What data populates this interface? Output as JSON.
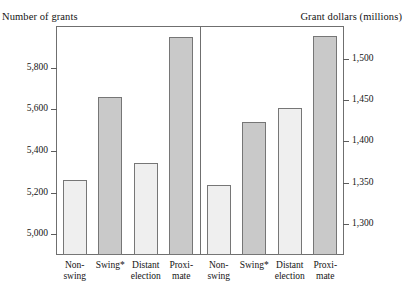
{
  "header": {
    "left_caption": "Number of grants",
    "right_caption": "Grant dollars (millions)"
  },
  "chart_data": {
    "type": "bar",
    "title": "",
    "subtitle": "",
    "grid": false,
    "legend": "none",
    "panels": [
      {
        "name": "number-of-grants",
        "ylabel": "Number of grants",
        "xlabel": "",
        "ylim": [
          4900,
          6000
        ],
        "yticks": [
          5000,
          5200,
          5400,
          5600,
          5800
        ],
        "ytick_labels": [
          "5,000",
          "5,200",
          "5,400",
          "5,600",
          "5,800"
        ],
        "categories": [
          "Non-swing",
          "Swing*",
          "Distant election",
          "Proximate"
        ],
        "category_lines": [
          [
            "Non-",
            "swing"
          ],
          [
            "Swing*",
            ""
          ],
          [
            "Distant",
            "election"
          ],
          [
            "Proxi-",
            "mate"
          ]
        ],
        "values": [
          5260,
          5660,
          5340,
          5945
        ],
        "value_labels": [
          "5,260",
          "5,660",
          "5,340",
          "5,945"
        ],
        "bar_styles": [
          "light",
          "dark",
          "light",
          "dark"
        ]
      },
      {
        "name": "grant-dollars-millions",
        "ylabel": "Grant dollars (millions)",
        "xlabel": "",
        "ylim": [
          1262,
          1540
        ],
        "yticks": [
          1300,
          1350,
          1400,
          1450,
          1500
        ],
        "ytick_labels": [
          "1,300",
          "1,350",
          "1,400",
          "1,450",
          "1,500"
        ],
        "categories": [
          "Non-swing",
          "Swing*",
          "Distant election",
          "Proximate"
        ],
        "category_lines": [
          [
            "Non-",
            "swing"
          ],
          [
            "Swing*",
            ""
          ],
          [
            "Distant",
            "election"
          ],
          [
            "Proxi-",
            "mate"
          ]
        ],
        "values": [
          1347,
          1423,
          1441,
          1528
        ],
        "value_labels": [
          "1,347",
          "1,423",
          "1,441",
          "1,528"
        ],
        "bar_styles": [
          "light",
          "dark",
          "light",
          "dark"
        ]
      }
    ],
    "colors": {
      "bar_light": "#efefef",
      "bar_dark": "#c9c9c9",
      "bar_border": "#767676",
      "frame": "#6f6f6f",
      "text": "#141414",
      "background": "#ffffff"
    },
    "footnote_marker": "*"
  }
}
